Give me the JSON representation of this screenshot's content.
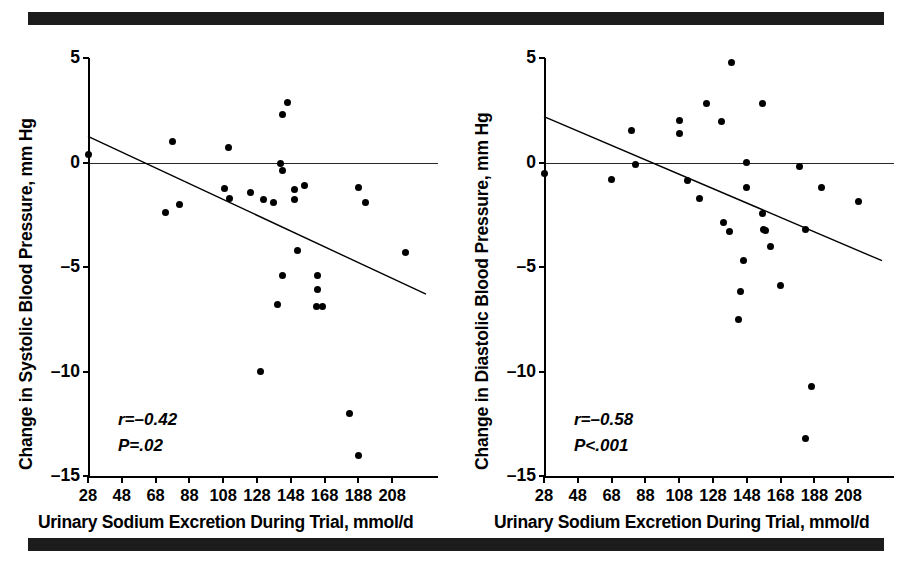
{
  "figure": {
    "rules": {
      "top_bar": "black-rule",
      "bottom_bar": "black-rule"
    },
    "panels": [
      {
        "id": "systolic",
        "ylabel": "Change in Systolic Blood Pressure, mm Hg",
        "xlabel": "Urinary Sodium Excretion During Trial, mmol/d",
        "stat_r": "r=–0.42",
        "stat_p": "P=.02"
      },
      {
        "id": "diastolic",
        "ylabel": "Change in Diastolic Blood Pressure, mm Hg",
        "xlabel": "Urinary Sodium Excretion During Trial, mmol/d",
        "stat_r": "r=–0.58",
        "stat_p": "P<.001"
      }
    ]
  },
  "chart_data": [
    {
      "type": "scatter",
      "id": "systolic",
      "title": "",
      "xlabel": "Urinary Sodium Excretion During Trial, mmol/d",
      "ylabel": "Change in Systolic Blood Pressure, mm Hg",
      "xlim": [
        28,
        228
      ],
      "ylim": [
        -15,
        5
      ],
      "xticks": [
        28,
        48,
        68,
        88,
        108,
        128,
        148,
        168,
        188,
        208
      ],
      "yticks": [
        5,
        0,
        -5,
        -10,
        -15
      ],
      "grid": false,
      "legend": null,
      "annotations": [
        "r=–0.42",
        "P=.02"
      ],
      "correlation_r": -0.42,
      "p_value": "=.02",
      "reference_line_y": 0,
      "regression_line": {
        "x0": 28,
        "y0": 1.25,
        "x1": 228,
        "y1": -6.3
      },
      "points": [
        {
          "x": 28,
          "y": 0.4
        },
        {
          "x": 78,
          "y": 1.0
        },
        {
          "x": 74,
          "y": -2.4
        },
        {
          "x": 82,
          "y": -2.0
        },
        {
          "x": 111,
          "y": 0.7
        },
        {
          "x": 109,
          "y": -1.25
        },
        {
          "x": 112,
          "y": -1.7
        },
        {
          "x": 124,
          "y": -1.45
        },
        {
          "x": 132,
          "y": -1.75
        },
        {
          "x": 138,
          "y": -1.9
        },
        {
          "x": 143,
          "y": 2.3
        },
        {
          "x": 146,
          "y": 2.85
        },
        {
          "x": 142,
          "y": -0.05
        },
        {
          "x": 143,
          "y": -0.4
        },
        {
          "x": 140,
          "y": -6.8
        },
        {
          "x": 143,
          "y": -5.4
        },
        {
          "x": 130,
          "y": -10.0
        },
        {
          "x": 150,
          "y": -1.3
        },
        {
          "x": 150,
          "y": -1.75
        },
        {
          "x": 156,
          "y": -1.1
        },
        {
          "x": 164,
          "y": -5.4
        },
        {
          "x": 164,
          "y": -6.1
        },
        {
          "x": 163,
          "y": -6.9
        },
        {
          "x": 167,
          "y": -6.9
        },
        {
          "x": 152,
          "y": -4.2
        },
        {
          "x": 183,
          "y": -12.0
        },
        {
          "x": 188,
          "y": -14.0
        },
        {
          "x": 188,
          "y": -1.2
        },
        {
          "x": 192,
          "y": -1.9
        },
        {
          "x": 216,
          "y": -4.3
        }
      ]
    },
    {
      "type": "scatter",
      "id": "diastolic",
      "title": "",
      "xlabel": "Urinary Sodium Excretion During Trial, mmol/d",
      "ylabel": "Change in Diastolic Blood Pressure, mm Hg",
      "xlim": [
        28,
        228
      ],
      "ylim": [
        -15,
        5
      ],
      "xticks": [
        28,
        48,
        68,
        88,
        108,
        128,
        148,
        168,
        188,
        208
      ],
      "yticks": [
        5,
        0,
        -5,
        -10,
        -15
      ],
      "grid": false,
      "legend": null,
      "annotations": [
        "r=–0.58",
        "P<.001"
      ],
      "correlation_r": -0.58,
      "p_value": "<.001",
      "reference_line_y": 0,
      "regression_line": {
        "x0": 28,
        "y0": 2.2,
        "x1": 228,
        "y1": -4.7
      },
      "points": [
        {
          "x": 28,
          "y": -0.55
        },
        {
          "x": 68,
          "y": -0.8
        },
        {
          "x": 80,
          "y": 1.55
        },
        {
          "x": 82,
          "y": -0.1
        },
        {
          "x": 108,
          "y": 2.0
        },
        {
          "x": 108,
          "y": 1.4
        },
        {
          "x": 113,
          "y": -0.85
        },
        {
          "x": 124,
          "y": 2.8
        },
        {
          "x": 120,
          "y": -1.7
        },
        {
          "x": 133,
          "y": 1.95
        },
        {
          "x": 139,
          "y": 4.8
        },
        {
          "x": 134,
          "y": -2.85
        },
        {
          "x": 138,
          "y": -3.3
        },
        {
          "x": 148,
          "y": 0.0
        },
        {
          "x": 148,
          "y": -1.2
        },
        {
          "x": 144,
          "y": -6.15
        },
        {
          "x": 146,
          "y": -4.7
        },
        {
          "x": 157,
          "y": 2.8
        },
        {
          "x": 157,
          "y": -2.45
        },
        {
          "x": 158,
          "y": -3.2
        },
        {
          "x": 159,
          "y": -3.25
        },
        {
          "x": 162,
          "y": -4.0
        },
        {
          "x": 168,
          "y": -5.9
        },
        {
          "x": 143,
          "y": -7.5
        },
        {
          "x": 179,
          "y": -0.2
        },
        {
          "x": 183,
          "y": -3.2
        },
        {
          "x": 186,
          "y": -10.7
        },
        {
          "x": 183,
          "y": -13.2
        },
        {
          "x": 192,
          "y": -1.2
        },
        {
          "x": 214,
          "y": -1.85
        }
      ]
    }
  ]
}
